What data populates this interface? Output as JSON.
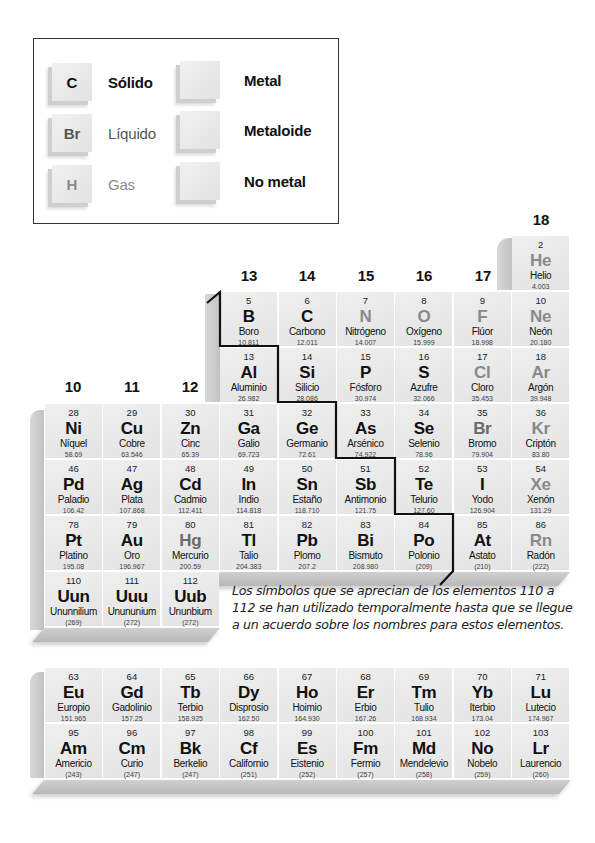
{
  "legend": {
    "states": [
      {
        "symbol": "C",
        "label": "Sólido",
        "state": "solid"
      },
      {
        "symbol": "Br",
        "label": "Líquido",
        "state": "liquid"
      },
      {
        "symbol": "H",
        "label": "Gas",
        "state": "gas"
      }
    ],
    "categories": [
      {
        "label": "Metal"
      },
      {
        "label": "Metaloide"
      },
      {
        "label": "No metal"
      }
    ]
  },
  "groups": {
    "g10": "10",
    "g11": "11",
    "g12": "12",
    "g13": "13",
    "g14": "14",
    "g15": "15",
    "g16": "16",
    "g17": "17",
    "g18": "18"
  },
  "elements": [
    {
      "n": "2",
      "s": "He",
      "name": "Helio",
      "m": "4.003",
      "st": "gas",
      "col": 8,
      "row": 1
    },
    {
      "n": "5",
      "s": "B",
      "name": "Boro",
      "m": "10.811",
      "st": "solid",
      "col": 3,
      "row": 2
    },
    {
      "n": "6",
      "s": "C",
      "name": "Carbono",
      "m": "12.011",
      "st": "solid",
      "col": 4,
      "row": 2
    },
    {
      "n": "7",
      "s": "N",
      "name": "Nitrógeno",
      "m": "14.007",
      "st": "gas",
      "col": 5,
      "row": 2
    },
    {
      "n": "8",
      "s": "O",
      "name": "Oxígeno",
      "m": "15.999",
      "st": "gas",
      "col": 6,
      "row": 2
    },
    {
      "n": "9",
      "s": "F",
      "name": "Flúor",
      "m": "18.998",
      "st": "gas",
      "col": 7,
      "row": 2
    },
    {
      "n": "10",
      "s": "Ne",
      "name": "Neón",
      "m": "20.180",
      "st": "gas",
      "col": 8,
      "row": 2
    },
    {
      "n": "13",
      "s": "Al",
      "name": "Aluminio",
      "m": "26.982",
      "st": "solid",
      "col": 3,
      "row": 3
    },
    {
      "n": "14",
      "s": "Si",
      "name": "Silicio",
      "m": "28.086",
      "st": "solid",
      "col": 4,
      "row": 3
    },
    {
      "n": "15",
      "s": "P",
      "name": "Fósforo",
      "m": "30.974",
      "st": "solid",
      "col": 5,
      "row": 3
    },
    {
      "n": "16",
      "s": "S",
      "name": "Azufre",
      "m": "32.066",
      "st": "solid",
      "col": 6,
      "row": 3
    },
    {
      "n": "17",
      "s": "Cl",
      "name": "Cloro",
      "m": "35.453",
      "st": "gas",
      "col": 7,
      "row": 3
    },
    {
      "n": "18",
      "s": "Ar",
      "name": "Argón",
      "m": "39.948",
      "st": "gas",
      "col": 8,
      "row": 3
    },
    {
      "n": "28",
      "s": "Ni",
      "name": "Níquel",
      "m": "58.69",
      "st": "solid",
      "col": 0,
      "row": 4
    },
    {
      "n": "29",
      "s": "Cu",
      "name": "Cobre",
      "m": "63.546",
      "st": "solid",
      "col": 1,
      "row": 4
    },
    {
      "n": "30",
      "s": "Zn",
      "name": "Cinc",
      "m": "65.39",
      "st": "solid",
      "col": 2,
      "row": 4
    },
    {
      "n": "31",
      "s": "Ga",
      "name": "Galio",
      "m": "69.723",
      "st": "solid",
      "col": 3,
      "row": 4
    },
    {
      "n": "32",
      "s": "Ge",
      "name": "Germanio",
      "m": "72.61",
      "st": "solid",
      "col": 4,
      "row": 4
    },
    {
      "n": "33",
      "s": "As",
      "name": "Arsénico",
      "m": "74.922",
      "st": "solid",
      "col": 5,
      "row": 4
    },
    {
      "n": "34",
      "s": "Se",
      "name": "Selenio",
      "m": "78.96",
      "st": "solid",
      "col": 6,
      "row": 4
    },
    {
      "n": "35",
      "s": "Br",
      "name": "Bromo",
      "m": "79.904",
      "st": "liquid",
      "col": 7,
      "row": 4
    },
    {
      "n": "36",
      "s": "Kr",
      "name": "Criptón",
      "m": "83.80",
      "st": "gas",
      "col": 8,
      "row": 4
    },
    {
      "n": "46",
      "s": "Pd",
      "name": "Paladio",
      "m": "106.42",
      "st": "solid",
      "col": 0,
      "row": 5
    },
    {
      "n": "47",
      "s": "Ag",
      "name": "Plata",
      "m": "107.868",
      "st": "solid",
      "col": 1,
      "row": 5
    },
    {
      "n": "48",
      "s": "Cd",
      "name": "Cadmio",
      "m": "112.411",
      "st": "solid",
      "col": 2,
      "row": 5
    },
    {
      "n": "49",
      "s": "In",
      "name": "Indio",
      "m": "114.818",
      "st": "solid",
      "col": 3,
      "row": 5
    },
    {
      "n": "50",
      "s": "Sn",
      "name": "Estaño",
      "m": "118.710",
      "st": "solid",
      "col": 4,
      "row": 5
    },
    {
      "n": "51",
      "s": "Sb",
      "name": "Antimonio",
      "m": "121.75",
      "st": "solid",
      "col": 5,
      "row": 5
    },
    {
      "n": "52",
      "s": "Te",
      "name": "Telurio",
      "m": "127.60",
      "st": "solid",
      "col": 6,
      "row": 5
    },
    {
      "n": "53",
      "s": "I",
      "name": "Yodo",
      "m": "126.904",
      "st": "solid",
      "col": 7,
      "row": 5
    },
    {
      "n": "54",
      "s": "Xe",
      "name": "Xenón",
      "m": "131.29",
      "st": "gas",
      "col": 8,
      "row": 5
    },
    {
      "n": "78",
      "s": "Pt",
      "name": "Platino",
      "m": "195.08",
      "st": "solid",
      "col": 0,
      "row": 6
    },
    {
      "n": "79",
      "s": "Au",
      "name": "Oro",
      "m": "196.967",
      "st": "solid",
      "col": 1,
      "row": 6
    },
    {
      "n": "80",
      "s": "Hg",
      "name": "Mercurio",
      "m": "200.59",
      "st": "liquid",
      "col": 2,
      "row": 6
    },
    {
      "n": "81",
      "s": "Tl",
      "name": "Talio",
      "m": "204.383",
      "st": "solid",
      "col": 3,
      "row": 6
    },
    {
      "n": "82",
      "s": "Pb",
      "name": "Plomo",
      "m": "207.2",
      "st": "solid",
      "col": 4,
      "row": 6
    },
    {
      "n": "83",
      "s": "Bi",
      "name": "Bismuto",
      "m": "208.980",
      "st": "solid",
      "col": 5,
      "row": 6
    },
    {
      "n": "84",
      "s": "Po",
      "name": "Polonio",
      "m": "(209)",
      "st": "solid",
      "col": 6,
      "row": 6
    },
    {
      "n": "85",
      "s": "At",
      "name": "Astato",
      "m": "(210)",
      "st": "solid",
      "col": 7,
      "row": 6
    },
    {
      "n": "86",
      "s": "Rn",
      "name": "Radón",
      "m": "(222)",
      "st": "gas",
      "col": 8,
      "row": 6
    },
    {
      "n": "110",
      "s": "Uun",
      "name": "Ununnilium",
      "m": "(269)",
      "st": "solid",
      "col": 0,
      "row": 7
    },
    {
      "n": "111",
      "s": "Uuu",
      "name": "Unununium",
      "m": "(272)",
      "st": "solid",
      "col": 1,
      "row": 7
    },
    {
      "n": "112",
      "s": "Uub",
      "name": "Ununbium",
      "m": "(272)",
      "st": "solid",
      "col": 2,
      "row": 7
    }
  ],
  "note": "Los símbolos que se aprecian de los elementos 110 a 112 se han utilizado temporalmente hasta que se llegue a un acuerdo sobre los nombres para estos elementos.",
  "inner_transition": [
    {
      "n": "63",
      "s": "Eu",
      "name": "Europio",
      "m": "151.965",
      "st": "solid",
      "col": 0,
      "row": 0
    },
    {
      "n": "64",
      "s": "Gd",
      "name": "Gadolinio",
      "m": "157.25",
      "st": "solid",
      "col": 1,
      "row": 0
    },
    {
      "n": "65",
      "s": "Tb",
      "name": "Terbio",
      "m": "158.925",
      "st": "solid",
      "col": 2,
      "row": 0
    },
    {
      "n": "66",
      "s": "Dy",
      "name": "Disprosio",
      "m": "162.50",
      "st": "solid",
      "col": 3,
      "row": 0
    },
    {
      "n": "67",
      "s": "Ho",
      "name": "Hoimio",
      "m": "164.930",
      "st": "solid",
      "col": 4,
      "row": 0
    },
    {
      "n": "68",
      "s": "Er",
      "name": "Erbio",
      "m": "167.26",
      "st": "solid",
      "col": 5,
      "row": 0
    },
    {
      "n": "69",
      "s": "Tm",
      "name": "Tulio",
      "m": "168.934",
      "st": "solid",
      "col": 6,
      "row": 0
    },
    {
      "n": "70",
      "s": "Yb",
      "name": "Iterbio",
      "m": "173.04",
      "st": "solid",
      "col": 7,
      "row": 0
    },
    {
      "n": "71",
      "s": "Lu",
      "name": "Lutecio",
      "m": "174.967",
      "st": "solid",
      "col": 8,
      "row": 0
    },
    {
      "n": "95",
      "s": "Am",
      "name": "Americio",
      "m": "(243)",
      "st": "solid",
      "col": 0,
      "row": 1
    },
    {
      "n": "96",
      "s": "Cm",
      "name": "Curio",
      "m": "(247)",
      "st": "solid",
      "col": 1,
      "row": 1
    },
    {
      "n": "97",
      "s": "Bk",
      "name": "Berkelio",
      "m": "(247)",
      "st": "solid",
      "col": 2,
      "row": 1
    },
    {
      "n": "98",
      "s": "Cf",
      "name": "Californio",
      "m": "(251)",
      "st": "solid",
      "col": 3,
      "row": 1
    },
    {
      "n": "99",
      "s": "Es",
      "name": "Eistenio",
      "m": "(252)",
      "st": "solid",
      "col": 4,
      "row": 1
    },
    {
      "n": "100",
      "s": "Fm",
      "name": "Fermio",
      "m": "(257)",
      "st": "solid",
      "col": 5,
      "row": 1
    },
    {
      "n": "101",
      "s": "Md",
      "name": "Mendelevio",
      "m": "(258)",
      "st": "solid",
      "col": 6,
      "row": 1
    },
    {
      "n": "102",
      "s": "No",
      "name": "Nobelo",
      "m": "(259)",
      "st": "solid",
      "col": 7,
      "row": 1
    },
    {
      "n": "103",
      "s": "Lr",
      "name": "Laurencio",
      "m": "(260)",
      "st": "solid",
      "col": 8,
      "row": 1
    }
  ]
}
